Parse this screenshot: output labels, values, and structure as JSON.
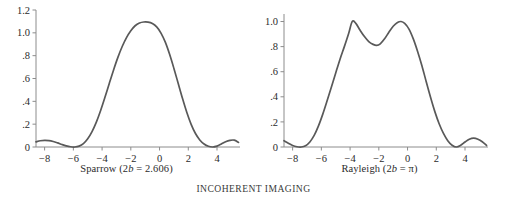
{
  "figure": {
    "caption": "INCOHERENT IMAGING",
    "background_color": "#ffffff",
    "curve_color": "#595959",
    "axis_color": "#8c8c8c",
    "text_color": "#2b2b2b"
  },
  "panels": [
    {
      "name": "sparrow",
      "caption_prefix": "Sparrow (2",
      "caption_italic": "b",
      "caption_suffix": " = 2.606)",
      "caption_full": "Sparrow (2b = 2.606)"
    },
    {
      "name": "rayleigh",
      "caption_prefix": "Rayleigh (2",
      "caption_italic": "b",
      "caption_suffix": " = π)",
      "caption_full": "Rayleigh (2b = π)"
    }
  ],
  "chart_data": [
    {
      "type": "line",
      "name": "sparrow",
      "title": "Sparrow (2b = 2.606)",
      "xlabel": "",
      "ylabel": "",
      "xlim": [
        -8.6,
        5.6
      ],
      "ylim": [
        0,
        1.2
      ],
      "xticks": [
        -8,
        -6,
        -4,
        -2,
        0,
        2,
        4
      ],
      "xtick_labels": [
        "−8",
        "−6",
        "−4",
        "−2",
        "0",
        "2",
        "4"
      ],
      "yticks": [
        0,
        0.2,
        0.4,
        0.6,
        0.8,
        1.0,
        1.2
      ],
      "ytick_labels": [
        "0",
        ".2",
        ".4",
        ".6",
        ".8",
        "1.0",
        "1.2"
      ],
      "grid": false,
      "legend": null,
      "x": [
        -8.6,
        -8.3,
        -8.0,
        -7.7,
        -7.4,
        -7.1,
        -6.8,
        -6.5,
        -6.2,
        -5.9,
        -5.6,
        -5.3,
        -5.0,
        -4.7,
        -4.4,
        -4.1,
        -3.8,
        -3.5,
        -3.2,
        -2.9,
        -2.6,
        -2.3,
        -2.0,
        -1.7,
        -1.4,
        -1.1,
        -0.8,
        -0.5,
        -0.2,
        0.1,
        0.4,
        0.7,
        1.0,
        1.3,
        1.6,
        1.9,
        2.2,
        2.5,
        2.8,
        3.1,
        3.4,
        3.7,
        4.0,
        4.3,
        4.6,
        4.9,
        5.2,
        5.5
      ],
      "y": [
        0.045,
        0.055,
        0.058,
        0.056,
        0.048,
        0.036,
        0.022,
        0.01,
        0.002,
        0.0,
        0.008,
        0.03,
        0.072,
        0.135,
        0.218,
        0.32,
        0.435,
        0.556,
        0.675,
        0.785,
        0.88,
        0.958,
        1.018,
        1.062,
        1.086,
        1.095,
        1.094,
        1.082,
        1.052,
        0.998,
        0.918,
        0.812,
        0.688,
        0.556,
        0.424,
        0.302,
        0.198,
        0.118,
        0.062,
        0.026,
        0.006,
        0.0,
        0.008,
        0.026,
        0.046,
        0.058,
        0.06,
        0.04
      ]
    },
    {
      "type": "line",
      "name": "rayleigh",
      "title": "Rayleigh (2b = π)",
      "xlabel": "",
      "ylabel": "",
      "xlim": [
        -8.6,
        5.6
      ],
      "ylim": [
        0,
        1.06
      ],
      "xticks": [
        -8,
        -6,
        -4,
        -2,
        0,
        2,
        4
      ],
      "xtick_labels": [
        "−8",
        "−6",
        "−4",
        "−2",
        "0",
        "2",
        "4"
      ],
      "yticks": [
        0,
        0.2,
        0.4,
        0.6,
        0.8,
        1.0
      ],
      "ytick_labels": [
        "0",
        ".2",
        ".4",
        ".6",
        ".8",
        "1.0"
      ],
      "grid": false,
      "legend": null,
      "peak_values": [
        1.0,
        1.0
      ],
      "peak_positions": [
        -3.85,
        -0.45
      ],
      "saddle_value": 0.81,
      "saddle_position": -2.15,
      "x": [
        -8.6,
        -8.3,
        -8.0,
        -7.7,
        -7.4,
        -7.1,
        -6.8,
        -6.5,
        -6.2,
        -5.9,
        -5.6,
        -5.3,
        -5.0,
        -4.7,
        -4.4,
        -4.1,
        -3.85,
        -3.6,
        -3.3,
        -3.0,
        -2.7,
        -2.4,
        -2.15,
        -1.9,
        -1.6,
        -1.3,
        -1.0,
        -0.7,
        -0.45,
        -0.2,
        0.1,
        0.4,
        0.7,
        1.0,
        1.3,
        1.6,
        1.9,
        2.2,
        2.5,
        2.8,
        3.1,
        3.4,
        3.7,
        4.0,
        4.3,
        4.6,
        4.9,
        5.2,
        5.5
      ],
      "y": [
        0.05,
        0.03,
        0.012,
        0.002,
        0.0,
        0.01,
        0.04,
        0.092,
        0.168,
        0.262,
        0.368,
        0.478,
        0.59,
        0.7,
        0.8,
        0.905,
        1.0,
        0.985,
        0.93,
        0.88,
        0.84,
        0.818,
        0.81,
        0.822,
        0.862,
        0.915,
        0.962,
        0.992,
        1.0,
        0.985,
        0.94,
        0.862,
        0.762,
        0.648,
        0.52,
        0.396,
        0.282,
        0.185,
        0.108,
        0.05,
        0.014,
        0.0,
        0.014,
        0.04,
        0.062,
        0.07,
        0.062,
        0.042,
        0.012
      ]
    }
  ]
}
